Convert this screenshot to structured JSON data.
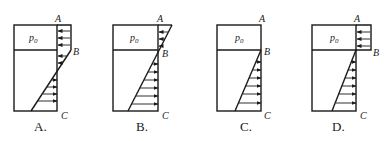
{
  "diagram": {
    "gas_label": "p",
    "gas_subscript": "0",
    "points": {
      "top": "A",
      "interface": "B",
      "bottom": "C"
    },
    "options": [
      {
        "label": "A.",
        "type": "gas-pressure-box-then-linear-crossing"
      },
      {
        "label": "B.",
        "type": "single-linear-from-top"
      },
      {
        "label": "C.",
        "type": "linear-from-interface-only"
      },
      {
        "label": "D.",
        "type": "gas-pressure-box-plus-linear-from-interface"
      }
    ],
    "colors": {
      "line": "#1a1a1a",
      "background": "#ffffff"
    }
  }
}
